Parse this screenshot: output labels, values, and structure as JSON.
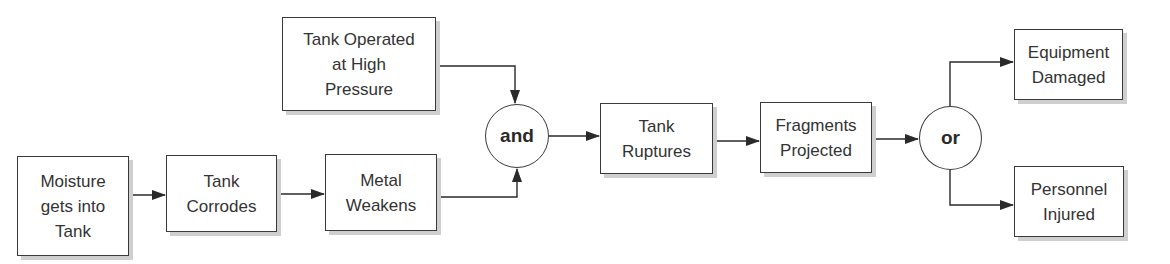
{
  "diagram": {
    "type": "event-chain",
    "nodes": {
      "moisture": {
        "lines": [
          "Moisture",
          "gets into",
          "Tank"
        ]
      },
      "corrodes": {
        "lines": [
          "Tank",
          "Corrodes"
        ]
      },
      "weakens": {
        "lines": [
          "Metal",
          "Weakens"
        ]
      },
      "pressure": {
        "lines": [
          "Tank Operated",
          "at High",
          "Pressure"
        ]
      },
      "and_gate": {
        "label": "and"
      },
      "ruptures": {
        "lines": [
          "Tank",
          "Ruptures"
        ]
      },
      "fragments": {
        "lines": [
          "Fragments",
          "Projected"
        ]
      },
      "or_gate": {
        "label": "or"
      },
      "equipment": {
        "lines": [
          "Equipment",
          "Damaged"
        ]
      },
      "personnel": {
        "lines": [
          "Personnel",
          "Injured"
        ]
      }
    },
    "edges": [
      [
        "moisture",
        "corrodes"
      ],
      [
        "corrodes",
        "weakens"
      ],
      [
        "weakens",
        "and_gate"
      ],
      [
        "pressure",
        "and_gate"
      ],
      [
        "and_gate",
        "ruptures"
      ],
      [
        "ruptures",
        "fragments"
      ],
      [
        "fragments",
        "or_gate"
      ],
      [
        "or_gate",
        "equipment"
      ],
      [
        "or_gate",
        "personnel"
      ]
    ]
  }
}
